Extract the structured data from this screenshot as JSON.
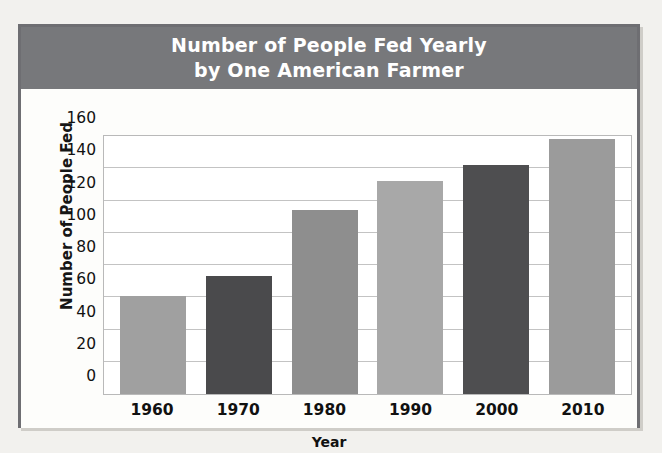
{
  "figure": {
    "title_line_1": "Number of People Fed Yearly",
    "title_line_2": "by One American Farmer",
    "banner_color": "#77787b",
    "frame_color": "#6e6e72",
    "background_color": "#fdfdfb"
  },
  "chart_data": {
    "type": "bar",
    "title": "Number of People Fed Yearly by One American Farmer",
    "xlabel": "Year",
    "ylabel": "Number of People Fed",
    "categories": [
      "1960",
      "1970",
      "1980",
      "1990",
      "2000",
      "2010"
    ],
    "values": [
      61,
      73,
      114,
      132,
      142,
      158
    ],
    "bar_colors": [
      "#a0a0a0",
      "#4a4a4c",
      "#8e8e8e",
      "#a8a8a8",
      "#4e4e50",
      "#9b9b9b"
    ],
    "ylim": [
      0,
      160
    ],
    "ytick_step": 20,
    "yticks": [
      "160",
      "140",
      "120",
      "100",
      "80",
      "60",
      "40",
      "20",
      "0"
    ],
    "ytick_values": [
      160,
      140,
      120,
      100,
      80,
      60,
      40,
      20,
      0
    ],
    "grid": true,
    "grid_color": "#c3c3c3",
    "legend": null,
    "legend_position": "none"
  }
}
